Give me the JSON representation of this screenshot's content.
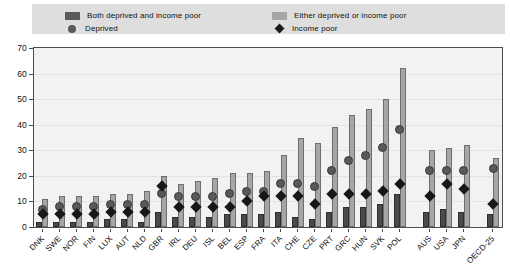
{
  "legend": {
    "items": [
      {
        "key": "both",
        "label": "Both deprived and income poor",
        "marker": "square-dark",
        "color": "#595959"
      },
      {
        "key": "either",
        "label": "Either deprived or income poor",
        "marker": "square-light",
        "color": "#a6a6a6"
      },
      {
        "key": "deprived",
        "label": "Deprived",
        "marker": "circle",
        "color": "#595959"
      },
      {
        "key": "income",
        "label": "Income poor",
        "marker": "diamond",
        "color": "#1a1a1a"
      }
    ]
  },
  "chart_data": {
    "type": "bar",
    "title": "",
    "subtitle": "",
    "xlabel": "",
    "ylabel": "",
    "ylim": [
      0,
      70
    ],
    "yticks": [
      0,
      10,
      20,
      30,
      40,
      50,
      60,
      70
    ],
    "ytick_labels": [
      "0",
      "10",
      "20",
      "30",
      "40",
      "50",
      "60",
      "70"
    ],
    "grid": true,
    "legend_position": "top",
    "categories": [
      "DNK",
      "SWE",
      "NOR",
      "FIN",
      "LUX",
      "AUT",
      "NLD",
      "GBR",
      "IRL",
      "DEU",
      "ISL",
      "BEL",
      "ESP",
      "FRA",
      "ITA",
      "CHE",
      "CZE",
      "PRT",
      "GRC",
      "HUN",
      "SVK",
      "POL",
      "AUS",
      "USA",
      "JPN",
      "OECD-25"
    ],
    "group_breaks_after": [
      "POL",
      "JPN"
    ],
    "series": [
      {
        "name": "Either deprived or income poor",
        "type": "bar",
        "color": "#a6a6a6",
        "values": [
          11,
          12,
          12,
          12,
          13,
          13,
          14,
          20,
          17,
          18,
          19,
          21,
          21,
          22,
          28,
          35,
          33,
          39,
          44,
          46,
          50,
          62,
          30,
          31,
          32,
          27
        ]
      },
      {
        "name": "Both deprived and income poor",
        "type": "bar",
        "color": "#4a4a4a",
        "values": [
          2,
          2,
          2,
          2,
          3,
          3,
          2,
          6,
          4,
          4,
          4,
          5,
          5,
          5,
          6,
          4,
          3,
          6,
          8,
          8,
          9,
          13,
          6,
          7,
          6,
          5
        ]
      },
      {
        "name": "Deprived",
        "type": "marker-circle",
        "color": "#595959",
        "values": [
          7,
          8,
          8,
          8,
          9,
          9,
          9,
          13,
          12,
          12,
          12,
          13,
          14,
          14,
          17,
          17,
          16,
          22,
          26,
          28,
          31,
          38,
          22,
          22,
          22,
          23
        ]
      },
      {
        "name": "Income poor",
        "type": "marker-diamond",
        "color": "#171717",
        "values": [
          5,
          5,
          5,
          5,
          6,
          6,
          6,
          16,
          8,
          8,
          8,
          8,
          10,
          12,
          12,
          12,
          9,
          13,
          13,
          13,
          14,
          17,
          12,
          17,
          15,
          9
        ]
      }
    ]
  }
}
